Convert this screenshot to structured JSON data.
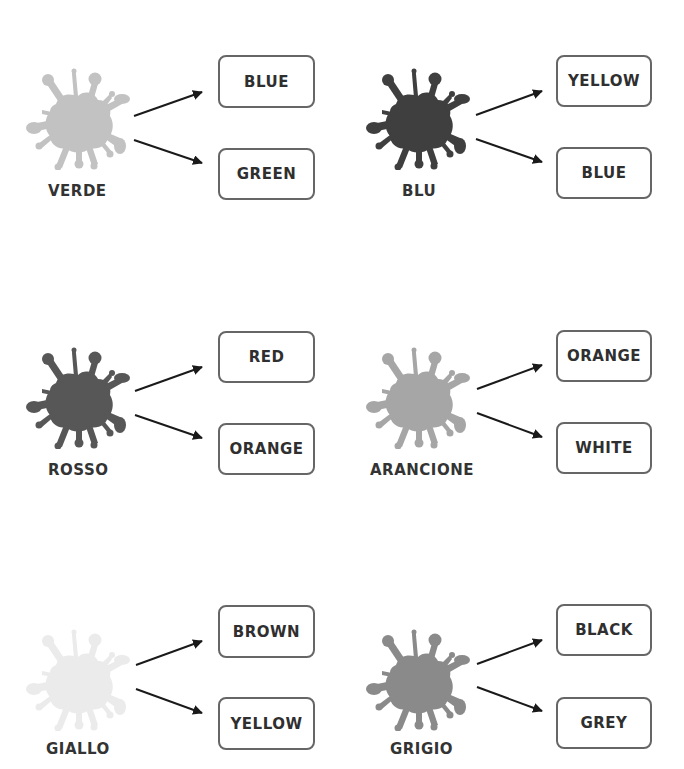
{
  "items": [
    {
      "label": "VERDE",
      "splash_color": "#c2c2c2",
      "options": [
        "BLUE",
        "GREEN"
      ]
    },
    {
      "label": "BLU",
      "splash_color": "#3f3f3f",
      "options": [
        "YELLOW",
        "BLUE"
      ]
    },
    {
      "label": "ROSSO",
      "splash_color": "#575757",
      "options": [
        "RED",
        "ORANGE"
      ]
    },
    {
      "label": "ARANCIONE",
      "splash_color": "#a6a6a6",
      "options": [
        "ORANGE",
        "WHITE"
      ]
    },
    {
      "label": "GIALLO",
      "splash_color": "#ebebeb",
      "options": [
        "BROWN",
        "YELLOW"
      ]
    },
    {
      "label": "GRIGIO",
      "splash_color": "#8a8a8a",
      "options": [
        "BLACK",
        "GREY"
      ]
    }
  ],
  "style": {
    "box_border_color": "#666666",
    "arrow_color": "#1a1a1a",
    "text_color": "#333333"
  }
}
